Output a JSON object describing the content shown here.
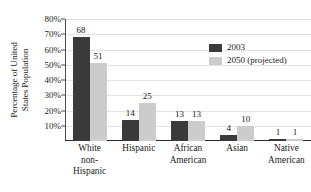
{
  "chart_data": {
    "type": "bar",
    "title": "",
    "xlabel": "",
    "ylabel": "Percentage of United States Population",
    "ylabel_lines": [
      "Percentage of United",
      "States Population"
    ],
    "categories": [
      "White non-Hispanic",
      "Hispanic",
      "African American",
      "Asian",
      "Native American"
    ],
    "category_lines": [
      [
        "White",
        "non-",
        "Hispanic"
      ],
      [
        "Hispanic"
      ],
      [
        "African",
        "American"
      ],
      [
        "Asian"
      ],
      [
        "Native",
        "American"
      ]
    ],
    "series": [
      {
        "name": "2003",
        "color": "#3a3a3a",
        "values": [
          68,
          14,
          13,
          4,
          1
        ]
      },
      {
        "name": "2050 (projected)",
        "color": "#cccccc",
        "values": [
          51,
          25,
          13,
          10,
          1
        ]
      }
    ],
    "ylim": [
      0,
      80
    ],
    "ytick_values": [
      10,
      20,
      30,
      40,
      50,
      60,
      70,
      80
    ],
    "ytick_labels": [
      "10%",
      "20%",
      "30%",
      "40%",
      "50%",
      "60%",
      "70%",
      "80%"
    ],
    "grid": true,
    "grid_color": "#e2e2e2",
    "legend_position": "top-right",
    "value_labels": true
  },
  "legend": {
    "entries": [
      {
        "label": "2003"
      },
      {
        "label": "2050 (projected)"
      }
    ]
  }
}
